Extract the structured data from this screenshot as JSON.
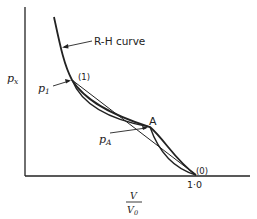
{
  "diagram": {
    "axes": {
      "y_label_main": "p",
      "y_label_sub": "x",
      "x_label_num": "V",
      "x_label_den_main": "V",
      "x_label_den_sub": "0",
      "x_tick": "1·0"
    },
    "curve_label": "R-H curve",
    "points": {
      "p1_main": "p",
      "p1_sub": "1",
      "pA_main": "p",
      "pA_sub": "A",
      "state1": "(1)",
      "stateA": "A",
      "state0": "(0)"
    }
  }
}
